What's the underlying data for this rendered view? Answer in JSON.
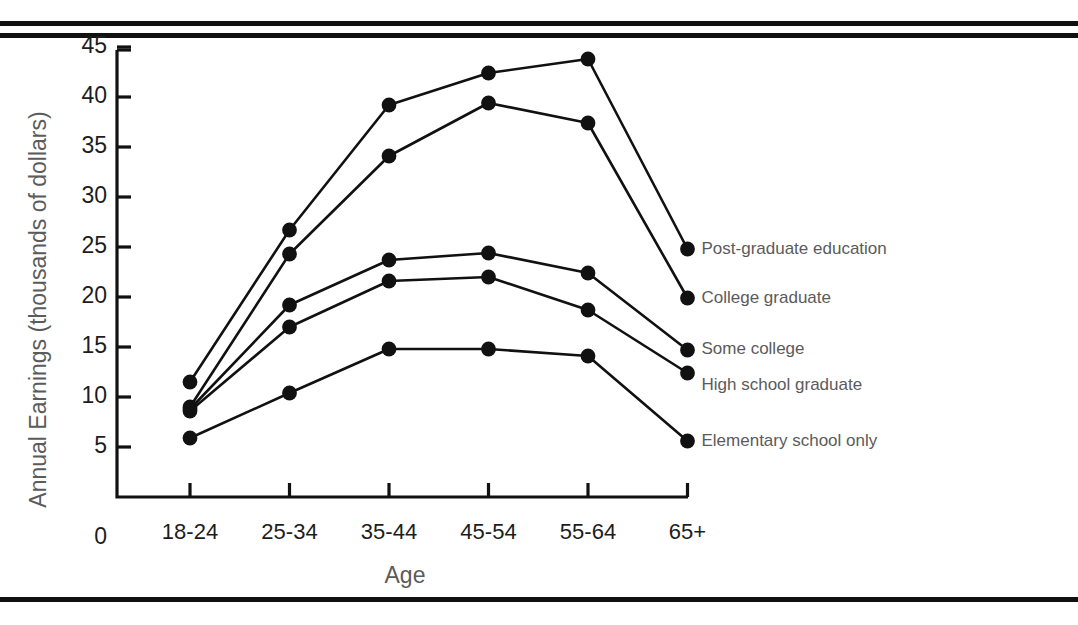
{
  "page": {
    "clipped_header_text": "",
    "rules": [
      "top-rule-1",
      "top-rule-2",
      "bottom-rule"
    ]
  },
  "chart_data": {
    "type": "line",
    "title": "",
    "xlabel": "Age",
    "ylabel": "Annual Earnings (thousands of dollars)",
    "categories": [
      "18-24",
      "25-34",
      "35-44",
      "45-54",
      "55-64",
      "65+"
    ],
    "ylim": [
      0,
      46
    ],
    "yticks": [
      5,
      10,
      15,
      20,
      25,
      30,
      35,
      40,
      45
    ],
    "ytick_labels": [
      "5",
      "10",
      "15",
      "20",
      "25",
      "30",
      "35",
      "40",
      "45"
    ],
    "zero_label": "0",
    "grid": false,
    "legend_position": "right-inline-end-of-line",
    "marker": "filled-circle",
    "series": [
      {
        "name": "Post-graduate education",
        "values": [
          11.5,
          26.7,
          39.2,
          42.4,
          43.8,
          24.8
        ]
      },
      {
        "name": "College graduate",
        "values": [
          9.0,
          24.3,
          34.1,
          39.4,
          37.4,
          19.9
        ]
      },
      {
        "name": "Some college",
        "values": [
          8.8,
          19.2,
          23.7,
          24.4,
          22.4,
          14.7
        ]
      },
      {
        "name": "High school graduate",
        "values": [
          8.6,
          17.0,
          21.6,
          22.0,
          18.7,
          12.4
        ]
      },
      {
        "name": "Elementary school only",
        "values": [
          5.9,
          10.4,
          14.8,
          14.8,
          14.1,
          5.6
        ]
      }
    ]
  },
  "axis": {
    "y_title": "Annual Earnings (thousands of dollars)",
    "x_title": "Age"
  }
}
